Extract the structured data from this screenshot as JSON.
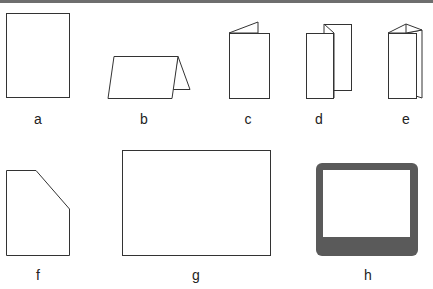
{
  "figures": [
    {
      "id": "a",
      "label": "a",
      "description": "flat sheet, portrait"
    },
    {
      "id": "b",
      "label": "b",
      "description": "tent fold card"
    },
    {
      "id": "c",
      "label": "c",
      "description": "single fold, portrait"
    },
    {
      "id": "d",
      "label": "d",
      "description": "gate / accordion fold"
    },
    {
      "id": "e",
      "label": "e",
      "description": "tri-fold, portrait"
    },
    {
      "id": "f",
      "label": "f",
      "description": "die-cut shape with clipped corner"
    },
    {
      "id": "g",
      "label": "g",
      "description": "flat sheet, landscape"
    },
    {
      "id": "h",
      "label": "h",
      "description": "frame / bordered card"
    }
  ],
  "colors": {
    "stroke": "#333333",
    "frame_fill": "#5a5a5a",
    "top_rule": "#6e6e6e"
  }
}
